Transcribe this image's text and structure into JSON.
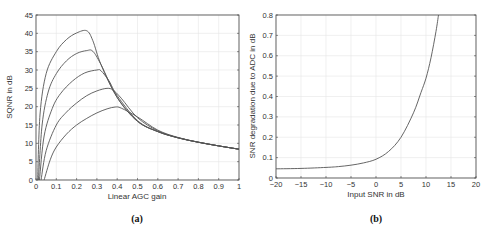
{
  "chart_data": [
    {
      "id": "a",
      "type": "line",
      "caption": "(a)",
      "title": "",
      "xlabel": "Linear AGC gain",
      "ylabel": "SQNR in dB",
      "xlim": [
        0,
        1
      ],
      "ylim": [
        0,
        45
      ],
      "xticks": [
        "0",
        "0.1",
        "0.2",
        "0.3",
        "0.4",
        "0.5",
        "0.6",
        "0.7",
        "0.8",
        "0.9",
        "1"
      ],
      "yticks": [
        "0",
        "5",
        "10",
        "15",
        "20",
        "25",
        "30",
        "35",
        "40",
        "45"
      ],
      "grid": true,
      "legend": null,
      "series": [
        {
          "name": "curve-1",
          "x": [
            0.008,
            0.02,
            0.05,
            0.1,
            0.15,
            0.2,
            0.25,
            0.28,
            0.32,
            0.4,
            0.5,
            0.6,
            0.7,
            0.8,
            0.9,
            1.0
          ],
          "y": [
            0,
            18,
            29,
            35,
            38.3,
            40.1,
            40.7,
            38,
            31.5,
            22.5,
            16,
            13.2,
            11.5,
            10.3,
            9.3,
            8.4
          ]
        },
        {
          "name": "curve-2",
          "x": [
            0.012,
            0.03,
            0.06,
            0.1,
            0.15,
            0.2,
            0.25,
            0.28,
            0.32,
            0.4,
            0.5,
            0.6,
            0.7,
            0.8,
            0.9,
            1.0
          ],
          "y": [
            0,
            15,
            24,
            29,
            32.5,
            34.5,
            35.3,
            35.1,
            31.5,
            22.5,
            16,
            13.2,
            11.5,
            10.3,
            9.3,
            8.4
          ]
        },
        {
          "name": "curve-3",
          "x": [
            0.017,
            0.04,
            0.08,
            0.12,
            0.18,
            0.24,
            0.3,
            0.32,
            0.36,
            0.4,
            0.5,
            0.6,
            0.7,
            0.8,
            0.9,
            1.0
          ],
          "y": [
            0,
            12,
            19.5,
            23.5,
            27,
            29.2,
            30,
            29.8,
            27,
            23,
            16.2,
            13.2,
            11.5,
            10.3,
            9.3,
            8.4
          ]
        },
        {
          "name": "curve-4",
          "x": [
            0.025,
            0.05,
            0.1,
            0.15,
            0.2,
            0.25,
            0.3,
            0.35,
            0.38,
            0.42,
            0.5,
            0.6,
            0.7,
            0.8,
            0.9,
            1.0
          ],
          "y": [
            0,
            8,
            15,
            18.5,
            21,
            23,
            24.3,
            25,
            24.5,
            22.3,
            17,
            13.4,
            11.5,
            10.3,
            9.3,
            8.4
          ]
        },
        {
          "name": "curve-5",
          "x": [
            0.04,
            0.07,
            0.1,
            0.15,
            0.2,
            0.25,
            0.3,
            0.35,
            0.39,
            0.42,
            0.5,
            0.6,
            0.7,
            0.8,
            0.9,
            1.0
          ],
          "y": [
            0,
            5.5,
            9,
            12.5,
            15,
            16.8,
            18.3,
            19.4,
            19.9,
            19.6,
            17.2,
            13.6,
            11.6,
            10.3,
            9.3,
            8.4
          ]
        }
      ]
    },
    {
      "id": "b",
      "type": "line",
      "caption": "(b)",
      "title": "",
      "xlabel": "Input SNR in dB",
      "ylabel": "SNR degradation due to ADC in dB",
      "xlim": [
        -20,
        20
      ],
      "ylim": [
        0,
        0.8
      ],
      "xticks": [
        "−20",
        "−15",
        "−10",
        "−5",
        "0",
        "5",
        "10",
        "15",
        "20"
      ],
      "yticks": [
        "0",
        "0.1",
        "0.2",
        "0.3",
        "0.4",
        "0.5",
        "0.6",
        "0.7",
        "0.8"
      ],
      "grid": true,
      "legend": null,
      "series": [
        {
          "name": "degradation",
          "x": [
            -20,
            -15,
            -10,
            -7.5,
            -5,
            -2.5,
            0,
            2.5,
            5,
            7.5,
            9,
            10,
            11,
            12,
            12.5
          ],
          "y": [
            0.045,
            0.047,
            0.052,
            0.056,
            0.063,
            0.074,
            0.092,
            0.13,
            0.2,
            0.32,
            0.42,
            0.49,
            0.59,
            0.72,
            0.8
          ]
        }
      ]
    }
  ]
}
